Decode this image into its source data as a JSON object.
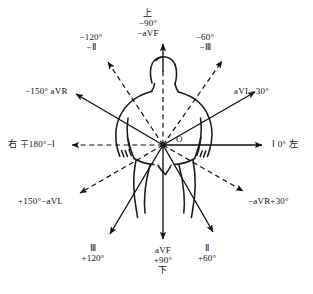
{
  "diagram": {
    "origin_label": "O",
    "center": {
      "x": 163,
      "y": 145
    },
    "colors": {
      "ink": "#111111",
      "background": "#ffffff"
    },
    "axes": [
      {
        "name": "lead-I-0",
        "angle_deg": 0,
        "style": "solid",
        "label_lines": [
          "Ⅰ 0° 左"
        ],
        "label_pos": {
          "x": 272,
          "y": 139
        },
        "align": "left"
      },
      {
        "name": "lead-aVL-minus30",
        "angle_deg": -30,
        "style": "solid",
        "label_lines": [
          "aVL−30°"
        ],
        "label_pos": {
          "x": 234,
          "y": 86
        },
        "align": "left"
      },
      {
        "name": "lead-minus-III-minus60",
        "angle_deg": -60,
        "style": "dashed",
        "label_lines": [
          "−60°",
          "−Ⅲ"
        ],
        "label_pos": {
          "x": 205,
          "y": 32
        },
        "align": "center"
      },
      {
        "name": "lead-minus-aVF-minus90",
        "angle_deg": -90,
        "style": "dashed-solid",
        "label_lines": [
          "上",
          "−90°",
          "−aVF"
        ],
        "label_pos": {
          "x": 148,
          "y": 8
        },
        "align": "center"
      },
      {
        "name": "lead-minus-II-minus120",
        "angle_deg": -120,
        "style": "dashed",
        "label_lines": [
          "−120°",
          "−Ⅱ"
        ],
        "label_pos": {
          "x": 91,
          "y": 32
        },
        "align": "center"
      },
      {
        "name": "lead-aVR-minus150",
        "angle_deg": -150,
        "style": "solid",
        "label_lines": [
          "−150° aVR"
        ],
        "label_pos": {
          "x": 25,
          "y": 86
        },
        "align": "left"
      },
      {
        "name": "lead-minus-I-180",
        "angle_deg": 180,
        "style": "dashed",
        "label_lines": [
          "右 ∓180°−Ⅰ"
        ],
        "label_pos": {
          "x": 8,
          "y": 139
        },
        "align": "left"
      },
      {
        "name": "lead-minus-aVL-plus150",
        "angle_deg": 150,
        "style": "dashed",
        "label_lines": [
          "+150°−aVL"
        ],
        "label_pos": {
          "x": 18,
          "y": 196
        },
        "align": "left"
      },
      {
        "name": "lead-III-plus120",
        "angle_deg": 120,
        "style": "solid",
        "label_lines": [
          "Ⅲ",
          "+120°"
        ],
        "label_pos": {
          "x": 93,
          "y": 243
        },
        "align": "center"
      },
      {
        "name": "lead-aVF-plus90",
        "angle_deg": 90,
        "style": "solid",
        "label_lines": [
          "aVF",
          "+90°",
          "下"
        ],
        "label_pos": {
          "x": 148,
          "y": 245
        },
        "align": "center"
      },
      {
        "name": "lead-II-plus60",
        "angle_deg": 60,
        "style": "solid",
        "label_lines": [
          "Ⅱ",
          "+60°"
        ],
        "label_pos": {
          "x": 200,
          "y": 243
        },
        "align": "center"
      },
      {
        "name": "lead-minus-aVR-plus30",
        "angle_deg": 30,
        "style": "dashed",
        "label_lines": [
          "−aVR+30°"
        ],
        "label_pos": {
          "x": 248,
          "y": 196
        },
        "align": "left"
      }
    ],
    "body_figure": {
      "name": "human-torso-outline",
      "description": "hand-drawn frontal human torso with head, shoulders, arms and legs"
    }
  }
}
